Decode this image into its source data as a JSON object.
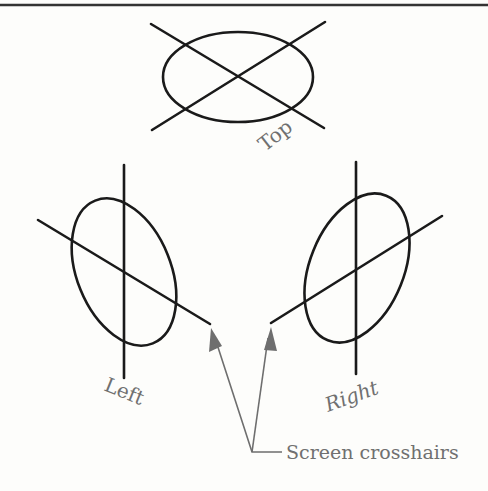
{
  "labels": {
    "top": "Top",
    "left": "Left",
    "right": "Right",
    "callout": "Screen crosshairs"
  },
  "colors": {
    "ink": "#1a1a1a",
    "label": "#707070",
    "arrow": "#6e6e6e",
    "background": "#fdfdfb"
  }
}
